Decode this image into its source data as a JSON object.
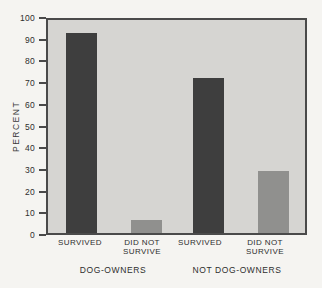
{
  "chart_data": {
    "type": "bar",
    "title": "",
    "xlabel": "",
    "ylabel": "PERCENT",
    "ylim": [
      0,
      100
    ],
    "y_ticks": [
      0,
      10,
      20,
      30,
      40,
      50,
      60,
      70,
      80,
      90,
      100
    ],
    "grid": false,
    "legend": "none",
    "categories": [
      "SURVIVED",
      "DID NOT SURVIVE",
      "SURVIVED",
      "DID NOT SURVIVE"
    ],
    "values": [
      94,
      6,
      73,
      29
    ],
    "groups": [
      {
        "label": "DOG-OWNERS",
        "bars": [
          {
            "label": "SURVIVED",
            "value": 94,
            "color_key": "dark"
          },
          {
            "label": "DID NOT SURVIVE",
            "value": 6,
            "color_key": "light"
          }
        ]
      },
      {
        "label": "NOT DOG-OWNERS",
        "bars": [
          {
            "label": "SURVIVED",
            "value": 73,
            "color_key": "dark"
          },
          {
            "label": "DID NOT SURVIVE",
            "value": 29,
            "color_key": "light"
          }
        ]
      }
    ],
    "colors": {
      "dark": "#3e3e3e",
      "light": "#90908e",
      "plot_background": "#d6d5d2",
      "paper_background": "#f5f4f1",
      "axis_line": "#4a4a4a",
      "text": "#2e2e2e"
    }
  }
}
